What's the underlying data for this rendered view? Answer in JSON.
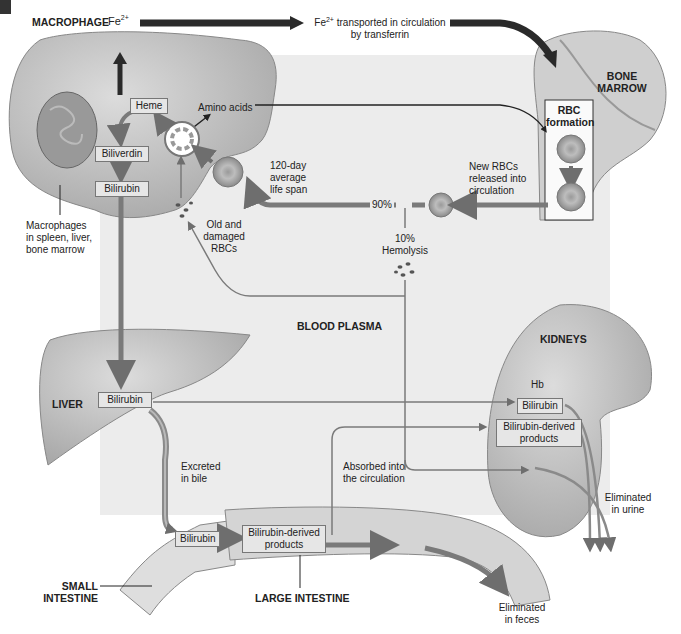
{
  "diagram": {
    "title_marker": "",
    "regions": {
      "macrophage": "MACROPHAGE",
      "bone_marrow_line1": "BONE",
      "bone_marrow_line2": "MARROW",
      "blood_plasma": "BLOOD PLASMA",
      "kidneys": "KIDNEYS",
      "liver": "LIVER",
      "small_intestine_line1": "SMALL",
      "small_intestine_line2": "INTESTINE",
      "large_intestine": "LARGE INTESTINE"
    },
    "boxes": {
      "heme": "Heme",
      "biliverdin": "Biliverdin",
      "bilirubin_macrophage": "Bilirubin",
      "bilirubin_liver": "Bilirubin",
      "bilirubin_kidney": "Bilirubin",
      "bilirubin_derived_kidney_1": "Bilirubin-derived",
      "bilirubin_derived_kidney_2": "products",
      "bilirubin_intestine": "Bilirubin",
      "bilirubin_derived_intestine_1": "Bilirubin-derived",
      "bilirubin_derived_intestine_2": "products",
      "rbc_formation_1": "RBC",
      "rbc_formation_2": "formation"
    },
    "labels": {
      "fe_macrophage": "Fe",
      "fe_superscript": "2+",
      "fe_transport_fe": "Fe",
      "fe_transport_1": " transported in circulation",
      "fe_transport_2": "by transferrin",
      "amino_acids": "Amino acids",
      "lifespan_1": "120-day",
      "lifespan_2": "average",
      "lifespan_3": "life span",
      "new_rbcs_1": "New RBCs",
      "new_rbcs_2": "released into",
      "new_rbcs_3": "circulation",
      "pct_90": "90%",
      "pct_10": "10%",
      "hemolysis": "Hemolysis",
      "old_rbcs_1": "Old and",
      "old_rbcs_2": "damaged",
      "old_rbcs_3": "RBCs",
      "macrophages_loc_1": "Macrophages",
      "macrophages_loc_2": "in spleen, liver,",
      "macrophages_loc_3": "bone marrow",
      "hb": "Hb",
      "excreted_1": "Excreted",
      "excreted_2": "in bile",
      "absorbed_1": "Absorbed into",
      "absorbed_2": "the circulation",
      "urine_1": "Eliminated",
      "urine_2": "in urine",
      "feces_1": "Eliminated",
      "feces_2": "in feces"
    },
    "colors": {
      "background_panel": "#ececec",
      "organ_fill": "#c8c8c8",
      "arrow_main": "#7a7a7a",
      "arrow_dark": "#2a2a2a"
    }
  }
}
